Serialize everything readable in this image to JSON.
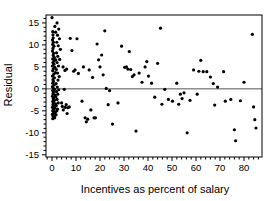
{
  "chart_data": {
    "type": "scatter",
    "title": "",
    "subtitle": "",
    "xlabel": "Incentives as percent of salary",
    "ylabel": "Residual",
    "xlim": [
      -2.5,
      87.5
    ],
    "ylim": [
      -15.5,
      16.8
    ],
    "xticks": [
      0,
      10,
      20,
      30,
      40,
      50,
      60,
      70,
      80
    ],
    "xticklabels": [
      "0",
      "10",
      "20",
      "30",
      "40",
      "50",
      "60",
      "70",
      "80"
    ],
    "yticks": [
      15,
      10,
      5,
      0,
      -5,
      -10,
      -15
    ],
    "yticklabels": [
      "15",
      "10",
      "5",
      "0",
      "-5",
      "-10",
      "-15"
    ],
    "minor_xtick_interval": 2,
    "grid": false,
    "legend": null,
    "reference_lines": [
      {
        "orientation": "horizontal",
        "value": 0,
        "color": "#555555",
        "width": 1
      }
    ],
    "marker": {
      "shape": "circle",
      "color": "#000000",
      "size_px": 2.6
    },
    "frame": {
      "visible": true,
      "color": "#000000",
      "width": 1
    },
    "series": [
      {
        "name": "residuals",
        "points": [
          [
            0.0,
            16.2
          ],
          [
            0.3,
            13.0
          ],
          [
            0.4,
            12.3
          ],
          [
            0.5,
            11.6
          ],
          [
            0.2,
            11.1
          ],
          [
            0.6,
            10.6
          ],
          [
            0.3,
            10.1
          ],
          [
            0.8,
            9.7
          ],
          [
            0.4,
            9.2
          ],
          [
            0.2,
            8.6
          ],
          [
            0.7,
            8.1
          ],
          [
            0.5,
            7.6
          ],
          [
            1.0,
            7.1
          ],
          [
            0.3,
            6.8
          ],
          [
            0.9,
            6.4
          ],
          [
            1.6,
            6.6
          ],
          [
            0.4,
            6.0
          ],
          [
            0.8,
            5.6
          ],
          [
            0.2,
            5.2
          ],
          [
            1.2,
            4.9
          ],
          [
            0.5,
            4.5
          ],
          [
            0.3,
            4.1
          ],
          [
            1.4,
            3.7
          ],
          [
            0.7,
            3.3
          ],
          [
            0.2,
            2.9
          ],
          [
            1.0,
            2.5
          ],
          [
            0.4,
            2.1
          ],
          [
            0.6,
            1.7
          ],
          [
            0.3,
            1.3
          ],
          [
            0.9,
            0.9
          ],
          [
            0.2,
            0.5
          ],
          [
            0.5,
            0.2
          ],
          [
            1.1,
            -0.1
          ],
          [
            0.3,
            -0.4
          ],
          [
            0.7,
            -0.8
          ],
          [
            0.4,
            -1.1
          ],
          [
            1.3,
            -1.4
          ],
          [
            0.2,
            -1.7
          ],
          [
            0.8,
            -2.0
          ],
          [
            0.5,
            -2.3
          ],
          [
            1.0,
            -2.6
          ],
          [
            0.3,
            -2.9
          ],
          [
            0.6,
            -3.2
          ],
          [
            1.5,
            -3.4
          ],
          [
            0.4,
            -3.6
          ],
          [
            0.9,
            -3.9
          ],
          [
            0.2,
            -4.2
          ],
          [
            1.2,
            -4.4
          ],
          [
            0.6,
            -4.7
          ],
          [
            0.3,
            -5.0
          ],
          [
            0.8,
            -5.2
          ],
          [
            1.4,
            -5.4
          ],
          [
            0.5,
            -5.6
          ],
          [
            0.2,
            -5.8
          ],
          [
            1.0,
            -6.0
          ],
          [
            0.4,
            -6.2
          ],
          [
            0.7,
            -6.4
          ],
          [
            1.1,
            -6.6
          ],
          [
            0.3,
            -6.8
          ],
          [
            0.9,
            -6.2
          ],
          [
            1.7,
            -5.9
          ],
          [
            2.0,
            -5.0
          ],
          [
            2.3,
            -4.6
          ],
          [
            1.8,
            -3.8
          ],
          [
            2.6,
            -3.2
          ],
          [
            2.1,
            -2.4
          ],
          [
            1.6,
            -1.8
          ],
          [
            2.4,
            -1.2
          ],
          [
            1.9,
            -0.6
          ],
          [
            2.8,
            -0.2
          ],
          [
            2.2,
            0.4
          ],
          [
            1.7,
            1.2
          ],
          [
            2.5,
            2.0
          ],
          [
            3.0,
            2.8
          ],
          [
            2.3,
            3.6
          ],
          [
            1.8,
            4.4
          ],
          [
            2.7,
            5.2
          ],
          [
            2.1,
            6.0
          ],
          [
            3.2,
            6.7
          ],
          [
            2.4,
            7.4
          ],
          [
            1.9,
            8.2
          ],
          [
            3.5,
            9.0
          ],
          [
            2.6,
            9.8
          ],
          [
            2.0,
            10.6
          ],
          [
            3.1,
            11.4
          ],
          [
            2.3,
            12.2
          ],
          [
            1.5,
            12.9
          ],
          [
            2.8,
            13.6
          ],
          [
            2.1,
            15.0
          ],
          [
            1.2,
            14.2
          ],
          [
            4.0,
            -3.2
          ],
          [
            4.3,
            -4.0
          ],
          [
            4.7,
            -4.8
          ],
          [
            5.1,
            -0.1
          ],
          [
            5.5,
            -4.2
          ],
          [
            5.9,
            -3.6
          ],
          [
            6.3,
            -5.6
          ],
          [
            6.6,
            -4.3
          ],
          [
            6.1,
            4.5
          ],
          [
            5.4,
            4.2
          ],
          [
            4.6,
            5.0
          ],
          [
            7.2,
            -4.1
          ],
          [
            7.6,
            11.5
          ],
          [
            8.3,
            8.7
          ],
          [
            9.0,
            4.0
          ],
          [
            9.6,
            4.3
          ],
          [
            10.4,
            11.4
          ],
          [
            11.0,
            3.5
          ],
          [
            12.5,
            -2.8
          ],
          [
            13.1,
            5.0
          ],
          [
            13.8,
            -6.6
          ],
          [
            14.3,
            -7.5
          ],
          [
            14.9,
            -6.9
          ],
          [
            15.5,
            4.3
          ],
          [
            16.2,
            -4.8
          ],
          [
            16.9,
            2.6
          ],
          [
            17.5,
            -6.6
          ],
          [
            18.1,
            -6.6
          ],
          [
            18.8,
            10.2
          ],
          [
            19.4,
            6.6
          ],
          [
            20.0,
            5.0
          ],
          [
            20.7,
            7.7
          ],
          [
            21.3,
            3.2
          ],
          [
            22.0,
            13.2
          ],
          [
            22.6,
            0.1
          ],
          [
            23.4,
            -3.6
          ],
          [
            24.0,
            -0.4
          ],
          [
            25.2,
            -8.0
          ],
          [
            27.5,
            -3.2
          ],
          [
            29.0,
            9.7
          ],
          [
            30.3,
            4.9
          ],
          [
            31.0,
            5.0
          ],
          [
            31.6,
            4.5
          ],
          [
            32.2,
            8.5
          ],
          [
            32.8,
            4.4
          ],
          [
            33.5,
            2.8
          ],
          [
            34.2,
            3.2
          ],
          [
            35.0,
            -9.6
          ],
          [
            36.3,
            3.6
          ],
          [
            37.5,
            1.5
          ],
          [
            38.8,
            5.0
          ],
          [
            39.5,
            6.2
          ],
          [
            40.2,
            2.9
          ],
          [
            41.5,
            1.3
          ],
          [
            42.8,
            -1.9
          ],
          [
            44.0,
            5.8
          ],
          [
            45.2,
            13.8
          ],
          [
            45.8,
            -3.5
          ],
          [
            47.0,
            -0.1
          ],
          [
            48.5,
            -2.4
          ],
          [
            50.2,
            -2.8
          ],
          [
            52.0,
            1.3
          ],
          [
            52.8,
            -3.5
          ],
          [
            53.5,
            -1.2
          ],
          [
            54.2,
            -2.2
          ],
          [
            55.0,
            -0.9
          ],
          [
            56.3,
            -10.0
          ],
          [
            57.5,
            -2.6
          ],
          [
            59.0,
            4.3
          ],
          [
            60.5,
            -1.2
          ],
          [
            61.2,
            4.0
          ],
          [
            62.0,
            6.5
          ],
          [
            63.0,
            3.9
          ],
          [
            64.5,
            3.9
          ],
          [
            66.0,
            2.7
          ],
          [
            67.2,
            1.2
          ],
          [
            67.8,
            -3.7
          ],
          [
            69.0,
            0.4
          ],
          [
            71.5,
            3.9
          ],
          [
            72.2,
            -2.8
          ],
          [
            74.5,
            -2.4
          ],
          [
            76.0,
            -9.3
          ],
          [
            76.5,
            -11.8
          ],
          [
            78.5,
            -2.7
          ],
          [
            80.0,
            1.5
          ],
          [
            83.5,
            12.4
          ],
          [
            84.0,
            -4.1
          ],
          [
            84.5,
            -7.0
          ],
          [
            85.0,
            -8.9
          ]
        ]
      }
    ]
  }
}
